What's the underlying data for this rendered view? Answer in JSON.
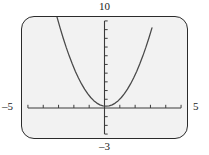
{
  "figure": {
    "title": ""
  },
  "labels": {
    "y_max": "10",
    "y_min": "–3",
    "x_min": "–5",
    "x_max": "5"
  },
  "colors": {
    "frame_border": "#2b2b2b",
    "screen_background": "#f2f2f2",
    "axis": "#3a3a3a",
    "curve": "#4a4a4a",
    "label_text": "#1a1a1a"
  },
  "chart_data": {
    "type": "line",
    "title": "",
    "xlabel": "",
    "ylabel": "",
    "xlim": [
      -5,
      5
    ],
    "ylim": [
      -3,
      10
    ],
    "grid": false,
    "legend": null,
    "axis_ticks": {
      "x_tick_step": 1,
      "x_ticks": [
        -5,
        -4,
        -3,
        -2,
        -1,
        0,
        1,
        2,
        3,
        4,
        5
      ],
      "y_tick_step": 1,
      "y_ticks": [
        -3,
        -2,
        -1,
        0,
        1,
        2,
        3,
        4,
        5,
        6,
        7,
        8,
        9,
        10
      ]
    },
    "series": [
      {
        "name": "parabola",
        "equation": "y = x^2 + 0.2",
        "vertex": [
          0.1,
          0.2
        ],
        "x": [
          -3.1,
          -2.9,
          -2.7,
          -2.5,
          -2.3,
          -2.1,
          -1.9,
          -1.7,
          -1.5,
          -1.3,
          -1.1,
          -0.9,
          -0.7,
          -0.5,
          -0.3,
          -0.1,
          0.1,
          0.3,
          0.5,
          0.7,
          0.9,
          1.1,
          1.3,
          1.5,
          1.7,
          1.9,
          2.1,
          2.3,
          2.5,
          2.7,
          2.9,
          3.1
        ],
        "values": [
          10.44,
          9.2,
          8.04,
          6.96,
          5.96,
          5.04,
          4.2,
          3.44,
          2.76,
          2.16,
          1.64,
          1.2,
          0.84,
          0.56,
          0.36,
          0.24,
          0.2,
          0.24,
          0.36,
          0.56,
          0.84,
          1.2,
          1.64,
          2.16,
          2.76,
          3.44,
          4.2,
          5.04,
          5.96,
          6.96,
          8.04,
          9.2
        ]
      }
    ]
  }
}
